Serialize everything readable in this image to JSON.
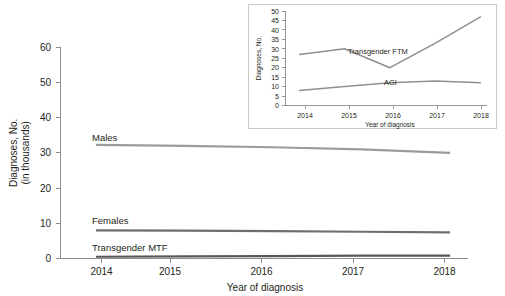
{
  "figure": {
    "background": "#ffffff",
    "main_chart": {
      "title": "",
      "xlabel": "Year of diagnosis",
      "ylabel_line1": "Diagnoses, No.",
      "ylabel_line2": "(in thousands)",
      "xticks": [
        "2014",
        "2015",
        "2016",
        "2017",
        "2018"
      ],
      "yticks": [
        "0",
        "10",
        "20",
        "30",
        "40",
        "50",
        "60"
      ],
      "series_labels": {
        "males": "Males",
        "females": "Females",
        "transgender_mtf": "Transgender MTF"
      },
      "colors": {
        "males": "#9b9b9b",
        "females": "#6e6e6e",
        "transgender_mtf": "#585858",
        "axis": "#8d8d8d",
        "text": "#231f20"
      }
    },
    "inset_chart": {
      "xlabel": "Year of diagnosis",
      "ylabel": "Diagnoses, No.",
      "xticks": [
        "2014",
        "2015",
        "2016",
        "2017",
        "2018"
      ],
      "yticks": [
        "0",
        "5",
        "10",
        "15",
        "20",
        "25",
        "30",
        "35",
        "40",
        "45",
        "50"
      ],
      "series_labels": {
        "transgender_ftm": "Transgender FTM",
        "agi": "AGI"
      },
      "colors": {
        "transgender_ftm": "#8f8f8f",
        "agi": "#8f8f8f",
        "frame": "#c9c9c9",
        "axis": "#8d8d8d",
        "text": "#231f20"
      }
    }
  },
  "chart_data": [
    {
      "type": "line",
      "id": "main",
      "title": "",
      "xlabel": "Year of diagnosis",
      "ylabel": "Diagnoses, No. (in thousands)",
      "x": [
        2014,
        2015,
        2016,
        2017,
        2018
      ],
      "xlim": [
        2013.6,
        2018.4
      ],
      "ylim": [
        0,
        60
      ],
      "yticks": [
        0,
        10,
        20,
        30,
        40,
        50,
        60
      ],
      "grid": false,
      "legend": "inline-labels",
      "series": [
        {
          "name": "Males",
          "values": [
            32.3,
            32.0,
            31.6,
            31.0,
            30.0
          ]
        },
        {
          "name": "Females",
          "values": [
            8.0,
            7.9,
            7.8,
            7.6,
            7.4
          ]
        },
        {
          "name": "Transgender MTF",
          "values": [
            0.5,
            0.6,
            0.7,
            0.8,
            0.8
          ]
        }
      ]
    },
    {
      "type": "line",
      "id": "inset",
      "title": "",
      "xlabel": "Year of diagnosis",
      "ylabel": "Diagnoses, No.",
      "x": [
        2014,
        2015,
        2016,
        2017,
        2018
      ],
      "xlim": [
        2013.7,
        2018.3
      ],
      "ylim": [
        0,
        50
      ],
      "yticks": [
        0,
        5,
        10,
        15,
        20,
        25,
        30,
        35,
        40,
        45,
        50
      ],
      "grid": false,
      "legend": "inline-labels",
      "series": [
        {
          "name": "Transgender FTM",
          "values": [
            27,
            30,
            20,
            33,
            47
          ]
        },
        {
          "name": "AGI",
          "values": [
            8,
            10,
            12,
            13,
            12
          ]
        }
      ]
    }
  ]
}
